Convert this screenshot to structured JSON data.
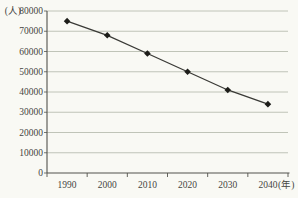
{
  "chart_data": {
    "type": "line",
    "title": "",
    "y_unit_label": "(人)",
    "x_unit_label": "(年)",
    "categories": [
      "1990",
      "2000",
      "2010",
      "2020",
      "2030",
      "2040"
    ],
    "series": [
      {
        "name": "population",
        "values": [
          75000,
          68000,
          59000,
          50000,
          41000,
          34000
        ]
      }
    ],
    "ylim": [
      0,
      80000
    ],
    "y_tick_interval": 10000,
    "y_tick_labels": [
      "0",
      "10000",
      "20000",
      "30000",
      "40000",
      "50000",
      "60000",
      "70000",
      "80000"
    ],
    "grid": true,
    "legend": false,
    "marker": "diamond",
    "line_style": "solid"
  },
  "colors": {
    "background": "#f9f9f4",
    "grid": "#b9bdb1",
    "axis": "#52524c",
    "line": "#3a3a36",
    "marker": "#1d1d19",
    "text": "#45453f"
  }
}
